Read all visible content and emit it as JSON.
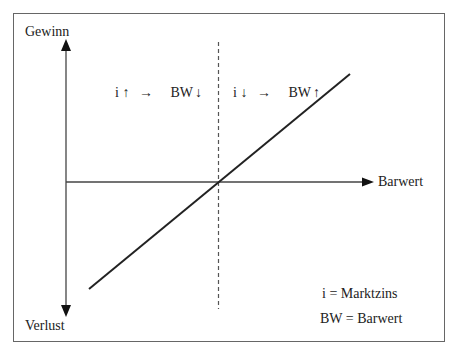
{
  "diagram": {
    "y_axis": {
      "top_label": "Gewinn",
      "bottom_label": "Verlust"
    },
    "x_axis": {
      "label": "Barwert"
    },
    "annotations": {
      "left": {
        "i": "i",
        "i_arrow": "↑",
        "implies": "→",
        "bw": "BW",
        "bw_arrow": "↓"
      },
      "right": {
        "i": "i",
        "i_arrow": "↓",
        "implies": "→",
        "bw": "BW",
        "bw_arrow": "↑"
      }
    },
    "legend": {
      "line1": "i = Marktzins",
      "line2": "BW = Barwert"
    },
    "colors": {
      "frame": "#666666",
      "axis": "#444444",
      "line": "#222222",
      "dashed": "#555555"
    }
  }
}
